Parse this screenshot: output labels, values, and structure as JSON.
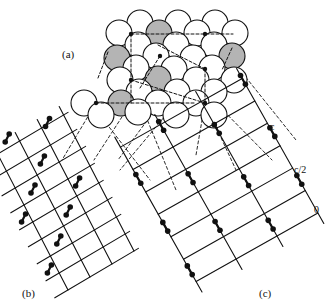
{
  "labels": {
    "a": "(a)",
    "b": "(b)",
    "c": "(c)",
    "c_axis_top": "c",
    "c_axis_half": "c/2",
    "c_axis_zero": "0"
  },
  "colors": {
    "line": "#111111",
    "atom_fill": "#ffffff",
    "atom_shaded": "#b4b4b4",
    "background": "#ffffff"
  },
  "panels": [
    {
      "id": "a",
      "description": "close-packed layer of atoms with shaded sites"
    },
    {
      "id": "b",
      "description": "projected lattice with paired atoms"
    },
    {
      "id": "c",
      "description": "projected lattice with c-axis heights 0, c/2, c"
    }
  ]
}
